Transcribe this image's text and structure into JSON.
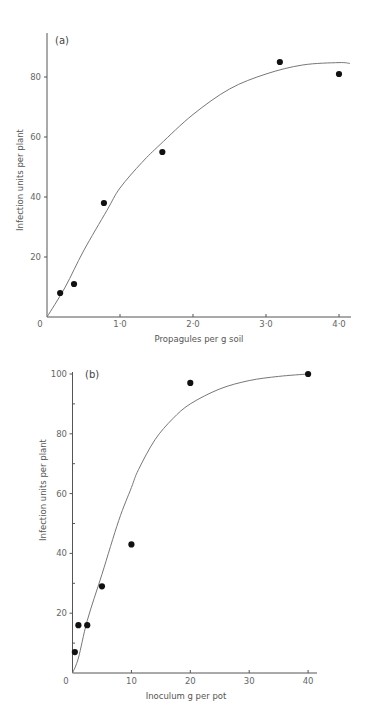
{
  "chart_data": [
    {
      "type": "scatter",
      "panel_label": "(a)",
      "xlabel": "Propagules per g soil",
      "ylabel": "Infection units per plant",
      "xlim": [
        0,
        4.15
      ],
      "ylim": [
        0,
        95
      ],
      "x_ticks": [
        {
          "v": 0,
          "label": "0"
        },
        {
          "v": 1,
          "label": "1·0"
        },
        {
          "v": 2,
          "label": "2·0"
        },
        {
          "v": 3,
          "label": "3·0"
        },
        {
          "v": 4,
          "label": "4·0"
        }
      ],
      "y_ticks": [
        {
          "v": 20,
          "label": "20"
        },
        {
          "v": 40,
          "label": "40"
        },
        {
          "v": 60,
          "label": "60"
        },
        {
          "v": 80,
          "label": "80"
        }
      ],
      "y_minor_ticks": [],
      "points": [
        {
          "x": 0.18,
          "y": 8
        },
        {
          "x": 0.37,
          "y": 11
        },
        {
          "x": 0.78,
          "y": 38
        },
        {
          "x": 1.58,
          "y": 55
        },
        {
          "x": 3.19,
          "y": 85
        },
        {
          "x": 4.0,
          "y": 81
        }
      ],
      "fitted_curve": [
        {
          "x": 0,
          "y": 0
        },
        {
          "x": 0.25,
          "y": 10
        },
        {
          "x": 0.5,
          "y": 22
        },
        {
          "x": 0.82,
          "y": 35.5
        },
        {
          "x": 1.0,
          "y": 43
        },
        {
          "x": 1.3,
          "y": 51.5
        },
        {
          "x": 1.55,
          "y": 57.5
        },
        {
          "x": 2.0,
          "y": 67.5
        },
        {
          "x": 2.5,
          "y": 76
        },
        {
          "x": 3.0,
          "y": 81
        },
        {
          "x": 3.5,
          "y": 84
        },
        {
          "x": 4.0,
          "y": 84.8
        },
        {
          "x": 4.15,
          "y": 84.5
        }
      ],
      "grid": false
    },
    {
      "type": "scatter",
      "panel_label": "(b)",
      "xlabel": "Inoculum g per pot",
      "ylabel": "Infection units per plant",
      "xlim": [
        0,
        41.5
      ],
      "ylim": [
        0,
        100
      ],
      "x_ticks": [
        {
          "v": 0,
          "label": "0"
        },
        {
          "v": 10,
          "label": "10"
        },
        {
          "v": 20,
          "label": "20"
        },
        {
          "v": 30,
          "label": "30"
        },
        {
          "v": 40,
          "label": "40"
        }
      ],
      "y_ticks": [
        {
          "v": 20,
          "label": "20"
        },
        {
          "v": 40,
          "label": "40"
        },
        {
          "v": 60,
          "label": "60"
        },
        {
          "v": 80,
          "label": "80"
        },
        {
          "v": 100,
          "label": "100"
        }
      ],
      "y_minor_ticks": [
        10,
        30,
        50,
        70,
        90
      ],
      "points": [
        {
          "x": 0.4,
          "y": 7
        },
        {
          "x": 1.0,
          "y": 16
        },
        {
          "x": 2.5,
          "y": 16
        },
        {
          "x": 5.0,
          "y": 29
        },
        {
          "x": 10.0,
          "y": 43
        },
        {
          "x": 20.0,
          "y": 97
        },
        {
          "x": 40.0,
          "y": 100
        }
      ],
      "fitted_curve": [
        {
          "x": 0,
          "y": 0
        },
        {
          "x": 1,
          "y": 5
        },
        {
          "x": 2.5,
          "y": 17.5
        },
        {
          "x": 5,
          "y": 33
        },
        {
          "x": 7.85,
          "y": 51
        },
        {
          "x": 10,
          "y": 62
        },
        {
          "x": 11.2,
          "y": 68
        },
        {
          "x": 14,
          "y": 78
        },
        {
          "x": 17,
          "y": 85
        },
        {
          "x": 20,
          "y": 90
        },
        {
          "x": 25,
          "y": 95
        },
        {
          "x": 30,
          "y": 97.8
        },
        {
          "x": 35,
          "y": 99.2
        },
        {
          "x": 40,
          "y": 100
        }
      ],
      "grid": false
    }
  ]
}
